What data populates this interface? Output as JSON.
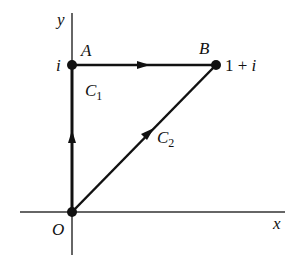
{
  "diagram": {
    "axes": {
      "x_label": "x",
      "y_label": "y"
    },
    "points": {
      "origin": {
        "label": "O"
      },
      "A": {
        "label": "A",
        "value": "i"
      },
      "B": {
        "label": "B",
        "value_num": "1 + ",
        "value_im": "i"
      }
    },
    "paths": {
      "C1": {
        "label": "C",
        "sub": "1",
        "description": "O → A → B"
      },
      "C2": {
        "label": "C",
        "sub": "2",
        "description": "O → B"
      }
    },
    "colors": {
      "stroke": "#111111",
      "background": "#ffffff"
    }
  }
}
